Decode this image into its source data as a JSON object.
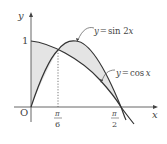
{
  "diagram": {
    "curves": [
      {
        "name": "sin2x",
        "label": "y = sin 2x",
        "label_y": "y",
        "label_eq": "=",
        "label_fn": "sin 2",
        "label_var": "x"
      },
      {
        "name": "cosx",
        "label": "y = cos x",
        "label_y": "y",
        "label_eq": "=",
        "label_fn": "cos",
        "label_var": "x"
      }
    ],
    "axes": {
      "x_label": "x",
      "y_label": "y",
      "origin_label": "O",
      "y_tick_label": "1"
    },
    "x_ticks": [
      {
        "value": "π/6",
        "num": "π",
        "den": "6"
      },
      {
        "value": "π/2",
        "num": "π",
        "den": "2"
      }
    ],
    "intersections": [
      "x = π/6",
      "x = π/2"
    ],
    "shaded_regions": [
      "0 ≤ x ≤ π/6 between cos x and sin 2x",
      "π/6 ≤ x ≤ π/2 between sin 2x and cos x"
    ],
    "colors": {
      "curve": "#333333",
      "axis": "#555555",
      "fill": "#e4e4e4",
      "text": "#444444"
    }
  }
}
